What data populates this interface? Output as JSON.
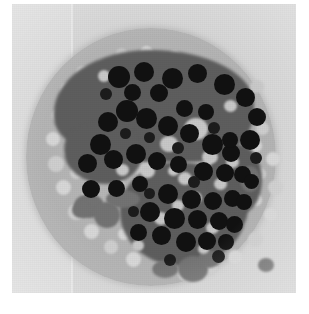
{
  "image": {
    "title": "Grayscale micrograph of a circular tissue specimen",
    "modality": "grayscale-micrograph",
    "alt_text": "Circular pale-gray specimen disk on a light gray field, containing two large dark cell-cluster masses studded with near-black round nuclei, surrounded by small pale vacuoles.",
    "canvas": {
      "width_px": 309,
      "height_px": 314,
      "background_color": "#ffffff"
    },
    "field": {
      "name": "image-field",
      "left_px": 12,
      "top_px": 4,
      "width_px": 284,
      "height_px": 289,
      "color": "#dcdcdc",
      "panel_split_x_px": 72,
      "panel_right_color": "#d5d5d5"
    },
    "disk": {
      "name": "specimen-disk",
      "center_x_px": 139,
      "center_y_px": 157,
      "radius_x_px": 125,
      "radius_y_px": 129,
      "color": "#b4b4b4"
    },
    "lumen": {
      "name": "central-pale-lumen",
      "center_x_px": 176,
      "center_y_px": 148,
      "width_px": 104,
      "height_px": 84,
      "color": "#cccccc"
    },
    "colors": {
      "background": "#ffffff",
      "field": "#dcdcdc",
      "field_right_panel": "#d5d5d5",
      "disk": "#b4b4b4",
      "vacuole": "#cfcfcf",
      "cluster_mass": "#5e5e5e",
      "nucleus": "#111111",
      "gray_blob": "#737373",
      "lumen": "#cccccc"
    },
    "regions": [
      {
        "name": "upper-cell-cluster",
        "label": "Upper dark cell cluster",
        "bbox_px": [
          42,
          46,
          200,
          112
        ]
      },
      {
        "name": "upper-cluster-tail",
        "label": "Upper cluster lower extension",
        "bbox_px": [
          52,
          118,
          78,
          62
        ]
      },
      {
        "name": "lower-cell-cluster",
        "label": "Lower dark cell cluster",
        "bbox_px": [
          108,
          158,
          128,
          104
        ]
      },
      {
        "name": "lower-cluster-arm",
        "label": "Lower cluster right arm",
        "bbox_px": [
          196,
          140,
          54,
          70
        ]
      }
    ],
    "vacuoles": [
      [
        48,
        78,
        17,
        17,
        "l"
      ],
      [
        64,
        62,
        13,
        13,
        ""
      ],
      [
        84,
        56,
        11,
        11,
        "l"
      ],
      [
        40,
        104,
        15,
        15,
        ""
      ],
      [
        34,
        128,
        14,
        14,
        "l"
      ],
      [
        36,
        152,
        16,
        16,
        ""
      ],
      [
        44,
        176,
        15,
        15,
        "l"
      ],
      [
        56,
        200,
        16,
        16,
        ""
      ],
      [
        72,
        220,
        15,
        15,
        "l"
      ],
      [
        92,
        236,
        14,
        14,
        ""
      ],
      [
        114,
        248,
        15,
        15,
        "l"
      ],
      [
        140,
        258,
        13,
        13,
        ""
      ],
      [
        166,
        262,
        15,
        15,
        "l"
      ],
      [
        192,
        258,
        13,
        13,
        ""
      ],
      [
        216,
        246,
        14,
        14,
        "l"
      ],
      [
        236,
        228,
        15,
        15,
        ""
      ],
      [
        252,
        204,
        13,
        13,
        "l"
      ],
      [
        256,
        176,
        15,
        15,
        ""
      ],
      [
        254,
        148,
        14,
        14,
        "l"
      ],
      [
        244,
        118,
        13,
        13,
        ""
      ],
      [
        226,
        92,
        14,
        14,
        "l"
      ],
      [
        204,
        70,
        12,
        12,
        ""
      ],
      [
        182,
        56,
        13,
        13,
        "l"
      ],
      [
        156,
        46,
        12,
        12,
        ""
      ],
      [
        128,
        42,
        13,
        13,
        "l"
      ],
      [
        104,
        44,
        11,
        11,
        "d"
      ],
      [
        62,
        112,
        13,
        13,
        "d"
      ],
      [
        52,
        140,
        14,
        14,
        "l"
      ],
      [
        58,
        162,
        13,
        13,
        ""
      ],
      [
        70,
        186,
        12,
        12,
        "l"
      ],
      [
        88,
        208,
        13,
        13,
        ""
      ],
      [
        106,
        224,
        12,
        12,
        "l"
      ],
      [
        130,
        236,
        13,
        13,
        ""
      ],
      [
        154,
        242,
        12,
        12,
        "l"
      ],
      [
        178,
        240,
        13,
        13,
        ""
      ],
      [
        200,
        230,
        12,
        12,
        "l"
      ],
      [
        222,
        212,
        12,
        12,
        ""
      ],
      [
        238,
        190,
        12,
        12,
        "l"
      ],
      [
        242,
        164,
        12,
        12,
        ""
      ],
      [
        238,
        136,
        12,
        12,
        "l"
      ],
      [
        78,
        92,
        12,
        12,
        "d"
      ],
      [
        90,
        120,
        11,
        11,
        "d"
      ],
      [
        100,
        172,
        12,
        12,
        "l"
      ],
      [
        84,
        152,
        11,
        11,
        "d"
      ]
    ],
    "nuclei": [
      [
        96,
        62,
        22,
        22
      ],
      [
        122,
        58,
        20,
        20
      ],
      [
        150,
        64,
        21,
        21
      ],
      [
        176,
        60,
        19,
        19
      ],
      [
        202,
        70,
        21,
        21
      ],
      [
        224,
        84,
        19,
        19
      ],
      [
        236,
        104,
        18,
        18
      ],
      [
        228,
        126,
        20,
        20
      ],
      [
        210,
        140,
        18,
        18
      ],
      [
        190,
        130,
        21,
        21
      ],
      [
        168,
        120,
        19,
        19
      ],
      [
        146,
        112,
        20,
        20
      ],
      [
        124,
        104,
        21,
        21
      ],
      [
        104,
        96,
        22,
        22
      ],
      [
        86,
        108,
        20,
        20
      ],
      [
        78,
        130,
        21,
        21
      ],
      [
        92,
        146,
        19,
        19
      ],
      [
        114,
        140,
        20,
        20
      ],
      [
        136,
        148,
        18,
        18
      ],
      [
        158,
        152,
        17,
        17
      ],
      [
        182,
        158,
        19,
        19
      ],
      [
        204,
        160,
        18,
        18
      ],
      [
        222,
        162,
        17,
        17
      ],
      [
        66,
        150,
        19,
        19
      ],
      [
        70,
        176,
        18,
        18
      ],
      [
        96,
        176,
        17,
        17
      ],
      [
        120,
        172,
        16,
        16
      ],
      [
        146,
        180,
        20,
        20
      ],
      [
        170,
        186,
        19,
        19
      ],
      [
        192,
        188,
        18,
        18
      ],
      [
        212,
        186,
        17,
        17
      ],
      [
        128,
        198,
        20,
        20
      ],
      [
        152,
        204,
        21,
        21
      ],
      [
        176,
        206,
        19,
        19
      ],
      [
        198,
        208,
        18,
        18
      ],
      [
        214,
        212,
        17,
        17
      ],
      [
        140,
        222,
        19,
        19
      ],
      [
        164,
        228,
        20,
        20
      ],
      [
        186,
        228,
        18,
        18
      ],
      [
        206,
        230,
        16,
        16
      ],
      [
        118,
        220,
        17,
        17
      ],
      [
        224,
        190,
        16,
        16
      ],
      [
        232,
        170,
        15,
        15
      ],
      [
        210,
        128,
        16,
        16
      ],
      [
        164,
        96,
        17,
        17
      ],
      [
        186,
        100,
        16,
        16
      ],
      [
        138,
        80,
        18,
        18
      ],
      [
        112,
        80,
        17,
        17
      ]
    ],
    "nuclei_small": [
      [
        88,
        84,
        12,
        12
      ],
      [
        160,
        138,
        12,
        12
      ],
      [
        196,
        118,
        12,
        12
      ],
      [
        108,
        124,
        11,
        11
      ],
      [
        132,
        128,
        11,
        11
      ],
      [
        176,
        172,
        12,
        12
      ],
      [
        132,
        184,
        11,
        11
      ],
      [
        200,
        246,
        13,
        13
      ],
      [
        152,
        250,
        12,
        12
      ],
      [
        116,
        202,
        11,
        11
      ],
      [
        238,
        148,
        12,
        12
      ]
    ],
    "highlight_holes": [
      [
        172,
        114,
        24,
        22
      ],
      [
        148,
        132,
        18,
        16
      ],
      [
        190,
        146,
        16,
        14
      ],
      [
        128,
        160,
        15,
        14
      ],
      [
        104,
        160,
        13,
        12
      ],
      [
        166,
        168,
        14,
        13
      ],
      [
        202,
        174,
        13,
        12
      ],
      [
        142,
        208,
        14,
        13
      ],
      [
        178,
        188,
        12,
        12
      ],
      [
        214,
        152,
        13,
        12
      ],
      [
        238,
        76,
        14,
        13
      ],
      [
        212,
        96,
        13,
        12
      ],
      [
        86,
        66,
        12,
        12
      ],
      [
        160,
        196,
        12,
        11
      ],
      [
        194,
        218,
        13,
        12
      ],
      [
        120,
        236,
        12,
        11
      ],
      [
        156,
        162,
        11,
        10
      ],
      [
        186,
        240,
        11,
        10
      ]
    ],
    "gray_blobs": [
      [
        62,
        190,
        30,
        24
      ],
      [
        82,
        198,
        26,
        26
      ],
      [
        94,
        186,
        34,
        18
      ],
      [
        140,
        256,
        26,
        18
      ],
      [
        166,
        252,
        30,
        26
      ],
      [
        186,
        246,
        22,
        18
      ],
      [
        228,
        162,
        20,
        26
      ],
      [
        60,
        198,
        18,
        16
      ],
      [
        246,
        254,
        16,
        14
      ]
    ]
  }
}
